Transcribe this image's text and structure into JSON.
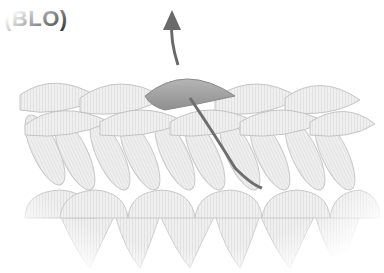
{
  "title": "(BLO)",
  "diagram": {
    "elements": [
      "stitch rows",
      "highlighted back loop",
      "hook path arrow"
    ],
    "colors": {
      "yarn_fill": "#ececec",
      "yarn_stroke": "#c8c8c8",
      "highlight_loop": "#9e9e9e",
      "arrow": "#6a6a6a",
      "title_text": "#2a2a2a"
    }
  }
}
